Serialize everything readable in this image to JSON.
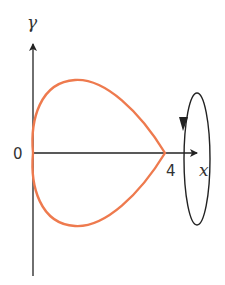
{
  "diagram": {
    "axes": {
      "x_label": "x",
      "y_label": "γ",
      "origin_label": "0",
      "x_tick_label": "4"
    },
    "curve": {
      "color": "#ee7a4e",
      "start_x": 0,
      "end_x": 4,
      "symmetric_about": "x-axis"
    },
    "rotation_indicator": {
      "shape": "ellipse around x-axis",
      "arrow_direction": "downward on near side",
      "color": "#222222"
    },
    "colors": {
      "axis": "#222222",
      "curve": "#ee7a4e",
      "text": "#333333"
    }
  }
}
